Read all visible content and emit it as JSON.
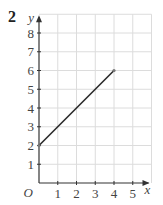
{
  "question_number": "2",
  "chart_data": {
    "type": "line",
    "title": "",
    "xlabel": "x",
    "ylabel": "y",
    "origin_label": "O",
    "x_ticks": [
      "1",
      "2",
      "3",
      "4",
      "5"
    ],
    "y_ticks": [
      "1",
      "2",
      "3",
      "4",
      "5",
      "6",
      "7",
      "8"
    ],
    "xlim": [
      0,
      6
    ],
    "ylim": [
      0,
      9
    ],
    "grid": true,
    "series": [
      {
        "name": "segment",
        "x": [
          0,
          4
        ],
        "y": [
          2,
          6
        ]
      }
    ],
    "colors": {
      "line": "#2a2a2a",
      "grid": "#dcdcdc",
      "axis": "#333333",
      "point": "#777777"
    }
  }
}
